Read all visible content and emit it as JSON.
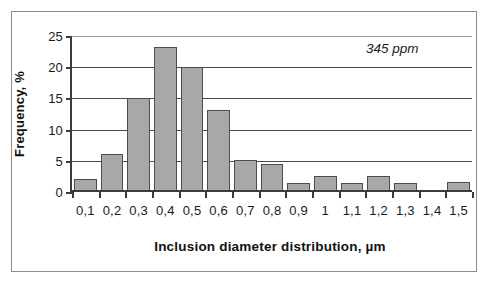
{
  "chart_data": {
    "type": "bar",
    "title": "",
    "xlabel": "Inclusion diameter  distribution, µm",
    "ylabel": "Frequency, %",
    "categories": [
      "0,1",
      "0,2",
      "0,3",
      "0,4",
      "0,5",
      "0,6",
      "0,7",
      "0,8",
      "0,9",
      "1",
      "1,1",
      "1,2",
      "1,3",
      "1,4",
      "1,5"
    ],
    "values": [
      2.1,
      6.1,
      15.0,
      23.2,
      20.0,
      13.2,
      5.2,
      4.5,
      1.4,
      2.5,
      1.5,
      2.6,
      1.5,
      0,
      1.6
    ],
    "ylim": [
      0,
      25
    ],
    "yticks": [
      "0",
      "5",
      "10",
      "15",
      "20",
      "25"
    ],
    "ytick_values": [
      0,
      5,
      10,
      15,
      20,
      25
    ],
    "grid": "horizontal",
    "legend": "none",
    "annotations": [
      {
        "text": "345 ppm",
        "style": "italic"
      }
    ],
    "colors": {
      "bar_fill": "#a8a8a8",
      "bar_stroke": "#4d4d4d",
      "axis": "#3c3c3c",
      "gridline": "#4a4a4a",
      "frame": "#8d8d8d",
      "background": "#ffffff",
      "text": "#111111"
    }
  }
}
